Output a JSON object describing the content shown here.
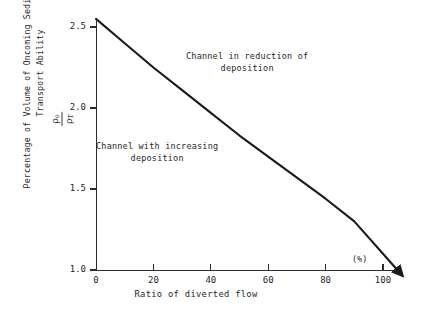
{
  "chart_data": {
    "type": "line",
    "title": "",
    "xlabel": "Ratio of diverted flow",
    "xunit": "(%)",
    "ylabel_line1": "Percentage of Volume of Oncoming Sediment and",
    "ylabel_line2": "Transport Ability",
    "ylabel_symbol_numerator": "ρ",
    "ylabel_symbol_numerator_sub": "o",
    "ylabel_symbol_denominator": "ρ",
    "ylabel_symbol_denominator_sub": "T",
    "xlim": [
      0,
      105
    ],
    "ylim": [
      1.0,
      2.65
    ],
    "grid": false,
    "legend": "none",
    "xticks": [
      0,
      20,
      40,
      60,
      80,
      100
    ],
    "xtick_labels": [
      "0",
      "20",
      "40",
      "60",
      "80",
      "100"
    ],
    "yticks": [
      1.0,
      1.5,
      2.0,
      2.5
    ],
    "ytick_labels": [
      "1.0",
      "1.5",
      "2.0",
      "2.5"
    ],
    "series": [
      {
        "name": "sediment transport ratio",
        "arrow_end": true,
        "x": [
          0,
          10,
          20,
          30,
          40,
          50,
          60,
          70,
          80,
          90,
          100,
          105
        ],
        "y": [
          2.55,
          2.4,
          2.25,
          2.11,
          1.97,
          1.83,
          1.7,
          1.57,
          1.44,
          1.3,
          1.1,
          1.0
        ]
      }
    ],
    "annotations": [
      {
        "name": "upper-region",
        "line1": "Channel in reduction of",
        "line2": "deposition",
        "x": 38,
        "y": 2.35
      },
      {
        "name": "lower-region",
        "line1": "Channel with increasing",
        "line2": "deposition",
        "x": 12,
        "y": 1.8
      }
    ]
  }
}
